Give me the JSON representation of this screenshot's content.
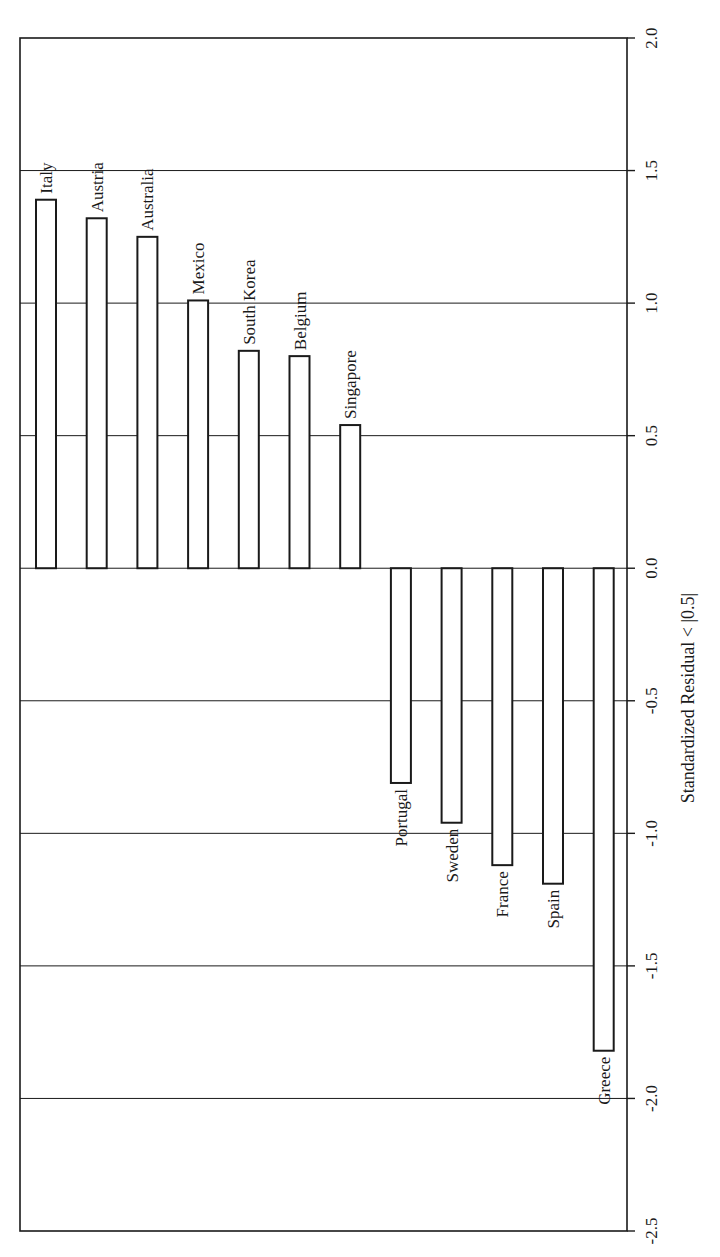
{
  "chart_data": {
    "type": "bar",
    "orientation": "rotated-90 (value axis on right, vertical; categories left-to-right)",
    "title": "",
    "xlabel": "",
    "ylabel": "Standardized Residual < |0.5|",
    "ylim": [
      -2.5,
      2.0
    ],
    "yticks": [
      "2.0",
      "1.5",
      "1.0",
      "0.5",
      "0.0",
      "-0.5",
      "-1.0",
      "-1.5",
      "-2.0",
      "-2.5"
    ],
    "grid": true,
    "categories": [
      "Italy",
      "Austria",
      "Australia",
      "Mexico",
      "South Korea",
      "Belgium",
      "Singapore",
      "Portugal",
      "Sweden",
      "France",
      "Spain",
      "Greece"
    ],
    "values": [
      1.39,
      1.32,
      1.25,
      1.01,
      0.82,
      0.8,
      0.54,
      -0.81,
      -0.96,
      -1.12,
      -1.19,
      -1.82
    ],
    "bar_fill": "#ffffff",
    "bar_stroke": "#1a1a1a"
  },
  "labels": {
    "axis_title": "Standardized Residual < |0.5|"
  }
}
